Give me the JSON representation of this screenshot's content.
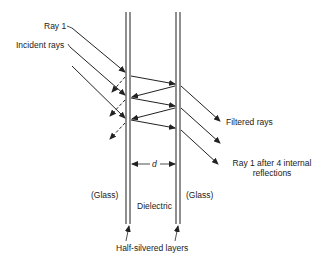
{
  "diagram": {
    "labels": {
      "ray1": "Ray 1",
      "incident_rays": "Incident rays",
      "filtered_rays": "Filtered rays",
      "ray1_after_line1": "Ray 1 after 4 internal",
      "ray1_after_line2": "reflections",
      "spacing": "d",
      "glass_left": "(Glass)",
      "glass_right": "(Glass)",
      "dielectric": "Dielectric",
      "half_silvered": "Half-silvered layers"
    },
    "colors": {
      "line": "#222222",
      "background": "#ffffff"
    }
  }
}
